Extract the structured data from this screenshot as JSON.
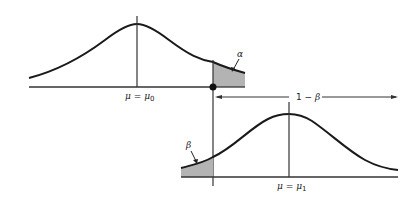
{
  "diagram": {
    "type": "hypothesis-test-power-diagram",
    "null_distribution": {
      "mean_label": "μ = μ0",
      "mean_symbol": "μ",
      "mean_rhs": "μ",
      "mean_sub": "0",
      "tail_label": "α"
    },
    "alt_distribution": {
      "mean_label": "μ = μ1",
      "mean_symbol": "μ",
      "mean_rhs": "μ",
      "mean_sub": "1",
      "tail_label": "β"
    },
    "power_label": "1 − β",
    "colors": {
      "curve": "#1a1a1a",
      "shade": "#b3b3b3",
      "axis": "#333333"
    }
  }
}
